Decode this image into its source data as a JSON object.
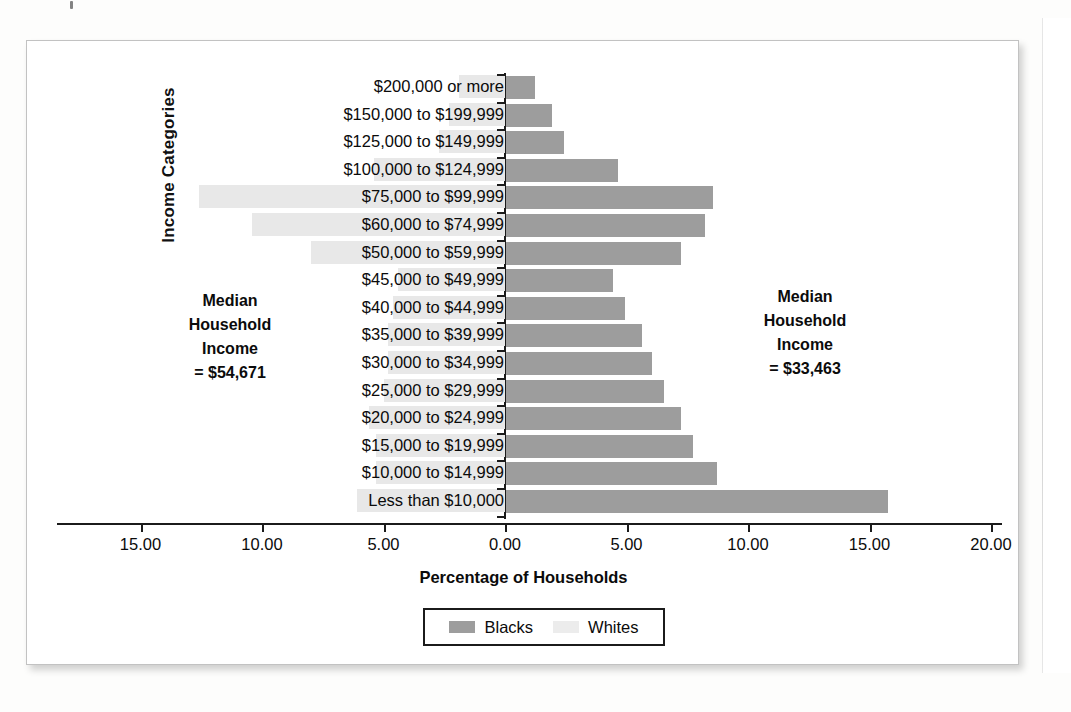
{
  "chart_data": {
    "type": "bar",
    "orientation": "horizontal",
    "layout": "diverging-population-pyramid",
    "title": "",
    "xlabel": "Percentage of Households",
    "ylabel": "Income Categories",
    "xlim": [
      -15,
      20
    ],
    "grid": false,
    "legend_position": "bottom-center",
    "axis_tick_labels": [
      "15.00",
      "10.00",
      "5.00",
      "0.00",
      "5.00",
      "10.00",
      "15.00",
      "20.00"
    ],
    "axis_tick_values": [
      -15,
      -10,
      -5,
      0,
      5,
      10,
      15,
      20
    ],
    "categories": [
      "$200,000 or more",
      "$150,000 to $199,999",
      "$125,000 to $149,999",
      "$100,000 to $124,999",
      "$75,000 to $99,999",
      "$60,000 to $74,999",
      "$50,000 to $59,999",
      "$45,000 to $49,999",
      "$40,000 to $44,999",
      "$35,000 to $39,999",
      "$30,000 to $34,999",
      "$25,000 to $29,999",
      "$20,000 to $24,999",
      "$15,000 to $19,999",
      "$10,000 to $14,999",
      "Less than $10,000"
    ],
    "series": [
      {
        "name": "Blacks",
        "direction": "right",
        "color": "#9d9d9d",
        "values": [
          1.2,
          1.9,
          2.4,
          4.6,
          8.5,
          8.2,
          7.2,
          4.4,
          4.9,
          5.6,
          6.0,
          6.5,
          7.2,
          7.7,
          8.7,
          15.7
        ]
      },
      {
        "name": "Whites",
        "direction": "left",
        "color": "#e8e8e8",
        "values": [
          1.9,
          2.3,
          2.7,
          5.4,
          12.6,
          10.4,
          8.0,
          4.4,
          4.6,
          4.8,
          4.8,
          5.0,
          5.6,
          5.3,
          5.3,
          6.1
        ]
      }
    ],
    "annotations": [
      {
        "id": "whites-median",
        "side": "left",
        "lines": [
          "Median",
          "Household",
          "Income",
          "= $54,671"
        ]
      },
      {
        "id": "blacks-median",
        "side": "right",
        "lines": [
          "Median",
          "Household",
          "Income",
          "= $33,463"
        ]
      }
    ],
    "legend": [
      {
        "label": "Blacks",
        "color": "#9d9d9d"
      },
      {
        "label": "Whites",
        "color": "#ececec"
      }
    ]
  },
  "colors": {
    "blacks_bar": "#9d9d9d",
    "whites_bar": "#e8e8e8",
    "axis": "#1b1b1b",
    "frame_border": "#c2c2c2",
    "page_background": "#fdfdfc"
  }
}
